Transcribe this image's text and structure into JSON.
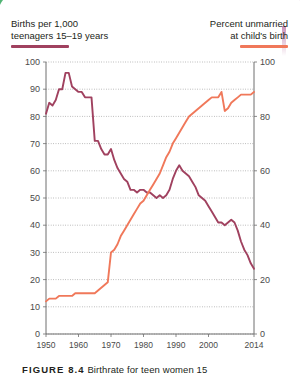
{
  "legend": {
    "left": {
      "line1": "Births per 1,000",
      "line2": "teenagers 15–19 years",
      "color": "#a0415f"
    },
    "right": {
      "line1": "Percent unmarried",
      "line2": "at child's birth",
      "color": "#f0785a"
    }
  },
  "caption": {
    "figure_label": "FIGURE 8.4",
    "text": "Birthrate for teen women 15"
  },
  "chart_data": {
    "type": "line",
    "title": "",
    "xlabel": "",
    "ylabel": "Births per 1,000 teenagers 15–19 years",
    "y2label": "Percent unmarried at child's birth",
    "xlim": [
      1950,
      2014
    ],
    "ylim": [
      0,
      100
    ],
    "y2lim": [
      0,
      100
    ],
    "grid": true,
    "legend_position": "top",
    "xticks": [
      1950,
      1960,
      1970,
      1980,
      1990,
      2000,
      2014
    ],
    "yticks": [
      0,
      10,
      20,
      30,
      40,
      50,
      60,
      70,
      80,
      90,
      100
    ],
    "y2ticks": [
      0,
      20,
      40,
      60,
      80,
      100
    ],
    "x": [
      1950,
      1951,
      1952,
      1953,
      1954,
      1955,
      1956,
      1957,
      1958,
      1959,
      1960,
      1961,
      1962,
      1963,
      1964,
      1965,
      1966,
      1967,
      1968,
      1969,
      1970,
      1971,
      1972,
      1973,
      1974,
      1975,
      1976,
      1977,
      1978,
      1979,
      1980,
      1981,
      1982,
      1983,
      1984,
      1985,
      1986,
      1987,
      1988,
      1989,
      1990,
      1991,
      1992,
      1993,
      1994,
      1995,
      1996,
      1997,
      1998,
      1999,
      2000,
      2001,
      2002,
      2003,
      2004,
      2005,
      2006,
      2007,
      2008,
      2009,
      2010,
      2011,
      2012,
      2013,
      2014
    ],
    "series": [
      {
        "name": "Births per 1,000 teenagers 15–19 years",
        "color": "#a0415f",
        "axis": "left",
        "values": [
          81,
          85,
          84,
          86,
          90,
          90,
          96,
          96,
          91,
          90,
          89,
          89,
          87,
          87,
          87,
          71,
          71,
          68,
          66,
          66,
          68,
          64,
          61,
          59,
          57,
          56,
          53,
          53,
          52,
          53,
          53,
          52,
          52,
          51,
          50,
          51,
          50,
          51,
          53,
          57,
          60,
          62,
          60,
          59,
          58,
          56,
          54,
          51,
          50,
          49,
          47,
          45,
          43,
          41,
          41,
          40,
          41,
          42,
          41,
          38,
          34,
          31,
          29,
          26,
          24
        ]
      },
      {
        "name": "Percent unmarried at child's birth",
        "color": "#f0785a",
        "axis": "right",
        "values": [
          12,
          13,
          13,
          13,
          14,
          14,
          14,
          14,
          14,
          15,
          15,
          15,
          15,
          15,
          15,
          15,
          16,
          17,
          18,
          19,
          30,
          31,
          33,
          36,
          38,
          40,
          42,
          44,
          46,
          48,
          49,
          51,
          53,
          55,
          57,
          59,
          62,
          65,
          67,
          70,
          72,
          74,
          76,
          78,
          80,
          81,
          82,
          83,
          84,
          85,
          86,
          87,
          87,
          87,
          89,
          82,
          83,
          85,
          86,
          87,
          88,
          88,
          88,
          88,
          89
        ]
      }
    ]
  }
}
